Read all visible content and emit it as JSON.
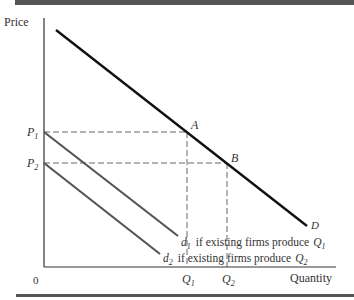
{
  "diagram": {
    "y_axis_label": "Price",
    "x_axis_label": "Quantity",
    "origin_label": "0",
    "price_labels": [
      {
        "main": "P",
        "sub": "1"
      },
      {
        "main": "P",
        "sub": "2"
      }
    ],
    "quantity_labels": [
      {
        "main": "Q",
        "sub": "1"
      },
      {
        "main": "Q",
        "sub": "2"
      }
    ],
    "points": [
      {
        "label": "A"
      },
      {
        "label": "B"
      }
    ],
    "curves": {
      "market_demand": {
        "label": "D"
      },
      "d1": {
        "main": "d",
        "sub": "1",
        "text": "if existing firms produce",
        "q_main": "Q",
        "q_sub": "1"
      },
      "d2": {
        "main": "d",
        "sub": "2",
        "text": "if existing firms produce",
        "q_main": "Q",
        "q_sub": "2"
      }
    },
    "colors": {
      "demand_line": "#111111",
      "residual_lines": "#555555",
      "axes": "#333333",
      "dashes": "#555555",
      "rules": "#555555"
    }
  }
}
